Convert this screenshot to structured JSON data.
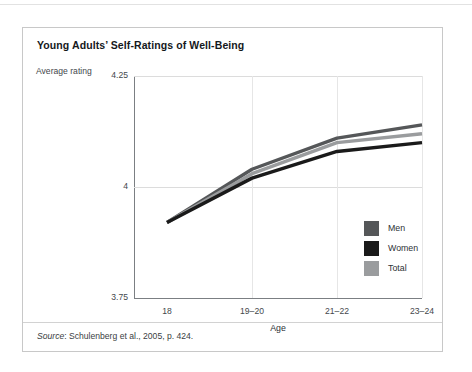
{
  "figure": {
    "title": "Young Adults’ Self-Ratings of Well-Being",
    "y_axis_caption": "Average rating",
    "source_prefix": "Source",
    "source_text": ": Schulenberg et al., 2005, p. 424."
  },
  "chart_data": {
    "type": "line",
    "title": "Young Adults’ Self-Ratings of Well-Being",
    "xlabel": "Age",
    "ylabel": "Average rating",
    "categories": [
      "18",
      "19–20",
      "21–22",
      "23–24"
    ],
    "ylim": [
      3.75,
      4.25
    ],
    "yticks": [
      "3.75",
      "4",
      "4.25"
    ],
    "ytick_values": [
      3.75,
      4.0,
      4.25
    ],
    "grid": true,
    "legend_position": "inside-bottom-right",
    "series": [
      {
        "name": "Men",
        "color": "#555759",
        "values": [
          3.92,
          4.04,
          4.11,
          4.14
        ]
      },
      {
        "name": "Women",
        "color": "#1a1a1a",
        "values": [
          3.92,
          4.02,
          4.08,
          4.1
        ]
      },
      {
        "name": "Total",
        "color": "#9a9c9e",
        "values": [
          3.92,
          4.03,
          4.1,
          4.12
        ]
      }
    ]
  }
}
